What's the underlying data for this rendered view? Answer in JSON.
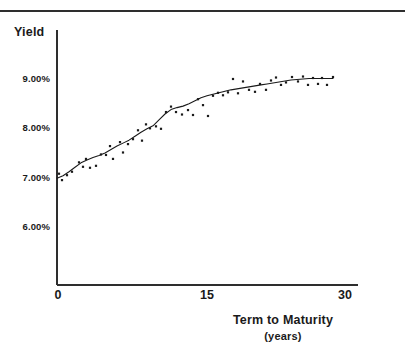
{
  "figure": {
    "has_top_rule": true,
    "background_color": "#ffffff",
    "ink_color": "#1a1a1a"
  },
  "chart_data": {
    "type": "scatter",
    "title": "",
    "subtitle": "",
    "xlabel": "Term to Maturity",
    "xlabel_units": "(years)",
    "ylabel": "Yield",
    "xlim": [
      0,
      30
    ],
    "ylim": [
      5.55,
      9.45
    ],
    "xticks": [
      0,
      15,
      30
    ],
    "xtick_labels": [
      "0",
      "15",
      "30"
    ],
    "yticks": [
      6.0,
      7.0,
      8.0,
      9.0
    ],
    "ytick_labels": [
      "6.00%",
      "7.00%",
      "8.00%",
      "9.00%"
    ],
    "grid": false,
    "legend": "none",
    "axis_style": "left-and-bottom-spines",
    "series": [
      {
        "name": "Observed yields",
        "type": "scatter",
        "marker": "small-dot",
        "color": "#1a1a1a",
        "points": [
          [
            0.2,
            7.06
          ],
          [
            0.5,
            6.93
          ],
          [
            1.0,
            7.03
          ],
          [
            1.5,
            7.1
          ],
          [
            2.2,
            7.29
          ],
          [
            2.6,
            7.2
          ],
          [
            2.9,
            7.36
          ],
          [
            3.3,
            7.18
          ],
          [
            3.9,
            7.22
          ],
          [
            4.4,
            7.45
          ],
          [
            4.9,
            7.44
          ],
          [
            5.3,
            7.62
          ],
          [
            5.6,
            7.36
          ],
          [
            6.3,
            7.7
          ],
          [
            6.6,
            7.49
          ],
          [
            7.1,
            7.66
          ],
          [
            7.6,
            7.76
          ],
          [
            8.1,
            7.94
          ],
          [
            8.5,
            7.73
          ],
          [
            8.9,
            8.06
          ],
          [
            9.3,
            7.98
          ],
          [
            9.9,
            8.02
          ],
          [
            10.4,
            7.97
          ],
          [
            10.9,
            8.31
          ],
          [
            11.4,
            8.42
          ],
          [
            11.9,
            8.31
          ],
          [
            12.5,
            8.26
          ],
          [
            13.1,
            8.35
          ],
          [
            13.6,
            8.25
          ],
          [
            14.1,
            8.57
          ],
          [
            14.6,
            8.45
          ],
          [
            15.1,
            8.23
          ],
          [
            15.6,
            8.64
          ],
          [
            16.1,
            8.7
          ],
          [
            16.6,
            8.65
          ],
          [
            17.1,
            8.71
          ],
          [
            17.6,
            8.98
          ],
          [
            18.1,
            8.69
          ],
          [
            18.6,
            8.93
          ],
          [
            19.2,
            8.76
          ],
          [
            19.8,
            8.72
          ],
          [
            20.3,
            8.88
          ],
          [
            20.9,
            8.76
          ],
          [
            21.4,
            8.95
          ],
          [
            21.9,
            9.01
          ],
          [
            22.4,
            8.86
          ],
          [
            22.9,
            8.91
          ],
          [
            23.5,
            9.02
          ],
          [
            24.1,
            8.93
          ],
          [
            24.6,
            9.03
          ],
          [
            25.1,
            8.86
          ],
          [
            25.6,
            9.0
          ],
          [
            26.1,
            8.88
          ],
          [
            26.5,
            9.0
          ],
          [
            27.0,
            8.86
          ],
          [
            27.6,
            9.02
          ]
        ]
      },
      {
        "name": "Fitted yield curve",
        "type": "line",
        "color": "#1a1a1a",
        "points": [
          [
            0.0,
            6.97
          ],
          [
            0.6,
            7.02
          ],
          [
            1.2,
            7.1
          ],
          [
            1.8,
            7.19
          ],
          [
            2.4,
            7.28
          ],
          [
            3.0,
            7.34
          ],
          [
            3.6,
            7.39
          ],
          [
            4.2,
            7.43
          ],
          [
            4.8,
            7.48
          ],
          [
            5.4,
            7.55
          ],
          [
            6.0,
            7.62
          ],
          [
            6.6,
            7.68
          ],
          [
            7.2,
            7.74
          ],
          [
            7.8,
            7.82
          ],
          [
            8.4,
            7.9
          ],
          [
            9.0,
            7.97
          ],
          [
            9.6,
            8.03
          ],
          [
            10.2,
            8.15
          ],
          [
            10.8,
            8.27
          ],
          [
            11.4,
            8.36
          ],
          [
            12.0,
            8.4
          ],
          [
            12.6,
            8.43
          ],
          [
            13.2,
            8.48
          ],
          [
            13.8,
            8.54
          ],
          [
            14.4,
            8.6
          ],
          [
            15.0,
            8.64
          ],
          [
            15.6,
            8.67
          ],
          [
            16.2,
            8.7
          ],
          [
            16.8,
            8.73
          ],
          [
            17.4,
            8.76
          ],
          [
            18.0,
            8.78
          ],
          [
            18.6,
            8.8
          ],
          [
            19.2,
            8.82
          ],
          [
            19.8,
            8.84
          ],
          [
            20.4,
            8.86
          ],
          [
            21.0,
            8.88
          ],
          [
            21.6,
            8.9
          ],
          [
            22.2,
            8.92
          ],
          [
            22.8,
            8.94
          ],
          [
            23.4,
            8.96
          ],
          [
            24.0,
            8.97
          ],
          [
            24.6,
            8.98
          ],
          [
            25.2,
            8.99
          ],
          [
            25.8,
            8.99
          ],
          [
            26.4,
            8.99
          ],
          [
            27.0,
            8.99
          ],
          [
            27.6,
            8.99
          ]
        ]
      }
    ]
  }
}
